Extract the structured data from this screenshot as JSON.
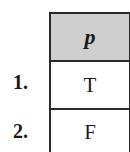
{
  "table": {
    "header": "p",
    "rows": [
      {
        "label": "1.",
        "value": "T"
      },
      {
        "label": "2.",
        "value": "F"
      }
    ]
  },
  "colors": {
    "header_bg": "#cfcfcf",
    "border": "#2a2a2a"
  }
}
